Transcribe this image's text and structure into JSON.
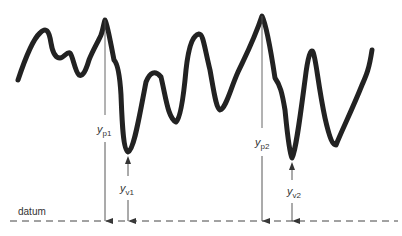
{
  "diagram": {
    "type": "surface-profile",
    "datum_label": "datum",
    "labels": {
      "yp1": {
        "main": "y",
        "sub": "p1"
      },
      "yv1": {
        "main": "y",
        "sub": "v1"
      },
      "yp2": {
        "main": "y",
        "sub": "p2"
      },
      "yv2": {
        "main": "y",
        "sub": "v2"
      }
    },
    "markers": [
      {
        "id": "peak-1",
        "x": 105,
        "y": 20
      },
      {
        "id": "valley-1",
        "x": 128,
        "y": 152
      },
      {
        "id": "peak-2",
        "x": 262,
        "y": 16
      },
      {
        "id": "valley-2",
        "x": 292,
        "y": 158
      }
    ],
    "colors": {
      "profile": "#222222",
      "lines": "#444444",
      "text": "#333333"
    }
  }
}
